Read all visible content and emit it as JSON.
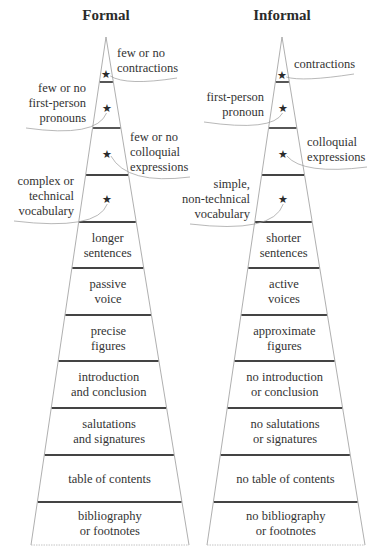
{
  "pyramids": [
    {
      "id": "formal",
      "title": "Formal",
      "geometry": {
        "apex_x": 106,
        "apex_y": 37,
        "base_y": 545,
        "base_left": 31,
        "base_right": 189
      },
      "divider_y": [
        82,
        128,
        175,
        222,
        268,
        315,
        361,
        408,
        455,
        502
      ],
      "tiers": [
        {
          "lines": [
            "longer",
            "sentences"
          ]
        },
        {
          "lines": [
            "passive",
            "voice"
          ]
        },
        {
          "lines": [
            "precise",
            "figures"
          ]
        },
        {
          "lines": [
            "introduction",
            "and conclusion"
          ]
        },
        {
          "lines": [
            "salutations",
            "and signatures"
          ]
        },
        {
          "lines": [
            "table of contents"
          ]
        },
        {
          "lines": [
            "bibliography",
            "or footnotes"
          ]
        }
      ],
      "starred": [
        {
          "lines": [
            "few or no",
            "contractions"
          ],
          "side": "right",
          "text_x": 117,
          "text_y": 57,
          "star_y": 74
        },
        {
          "lines": [
            "few or no",
            "first-person",
            "pronouns"
          ],
          "side": "left",
          "text_x": 86,
          "text_y": 92,
          "star_y": 108
        },
        {
          "lines": [
            "few or no",
            "colloquial",
            "expressions"
          ],
          "side": "right",
          "text_x": 130,
          "text_y": 141,
          "star_y": 154
        },
        {
          "lines": [
            "complex or",
            "technical",
            "vocabulary"
          ],
          "side": "left",
          "text_x": 74,
          "text_y": 185,
          "star_y": 199
        }
      ]
    },
    {
      "id": "informal",
      "title": "Informal",
      "geometry": {
        "apex_x": 282,
        "apex_y": 37,
        "base_y": 545,
        "base_left": 207,
        "base_right": 365
      },
      "divider_y": [
        82,
        128,
        175,
        222,
        268,
        315,
        361,
        408,
        455,
        502
      ],
      "tiers": [
        {
          "lines": [
            "shorter",
            "sentences"
          ]
        },
        {
          "lines": [
            "active",
            "voices"
          ]
        },
        {
          "lines": [
            "approximate",
            "figures"
          ]
        },
        {
          "lines": [
            "no introduction",
            "or conclusion"
          ]
        },
        {
          "lines": [
            "no salutations",
            "or signatures"
          ]
        },
        {
          "lines": [
            "no table of contents"
          ]
        },
        {
          "lines": [
            "no bibliography",
            "or footnotes"
          ]
        }
      ],
      "starred": [
        {
          "lines": [
            "contractions"
          ],
          "side": "right",
          "text_x": 294,
          "text_y": 68,
          "star_y": 75
        },
        {
          "lines": [
            "first-person",
            "pronoun"
          ],
          "side": "left",
          "text_x": 264,
          "text_y": 101,
          "star_y": 108
        },
        {
          "lines": [
            "colloquial",
            "expressions"
          ],
          "side": "right",
          "text_x": 307,
          "text_y": 146,
          "star_y": 154
        },
        {
          "lines": [
            "simple,",
            "non-technical",
            "vocabulary"
          ],
          "side": "left",
          "text_x": 250,
          "text_y": 188,
          "star_y": 199
        }
      ]
    }
  ],
  "icons": {
    "star": "★"
  }
}
